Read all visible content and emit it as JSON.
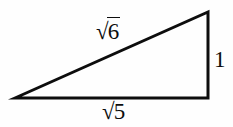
{
  "figure": {
    "type": "right-triangle",
    "background_color": "#fefefe",
    "stroke_color": "#0d0d0d",
    "text_color": "#0d0d0d"
  },
  "geometry": {
    "vertices": {
      "left": {
        "x": 15,
        "y": 98
      },
      "apex": {
        "x": 208,
        "y": 12
      },
      "right_angle": {
        "x": 208,
        "y": 98
      }
    },
    "points_attr": "15,98 208,12 208,98"
  },
  "labels": {
    "hypotenuse": {
      "name": "sqrt-6",
      "radical_sign": "√",
      "radicand": "6",
      "full_text": "√6"
    },
    "base": {
      "name": "sqrt-5",
      "radical_sign": "√",
      "radicand": "5",
      "full_text": "√5"
    },
    "vertical": {
      "name": "one",
      "full_text": "1"
    }
  }
}
